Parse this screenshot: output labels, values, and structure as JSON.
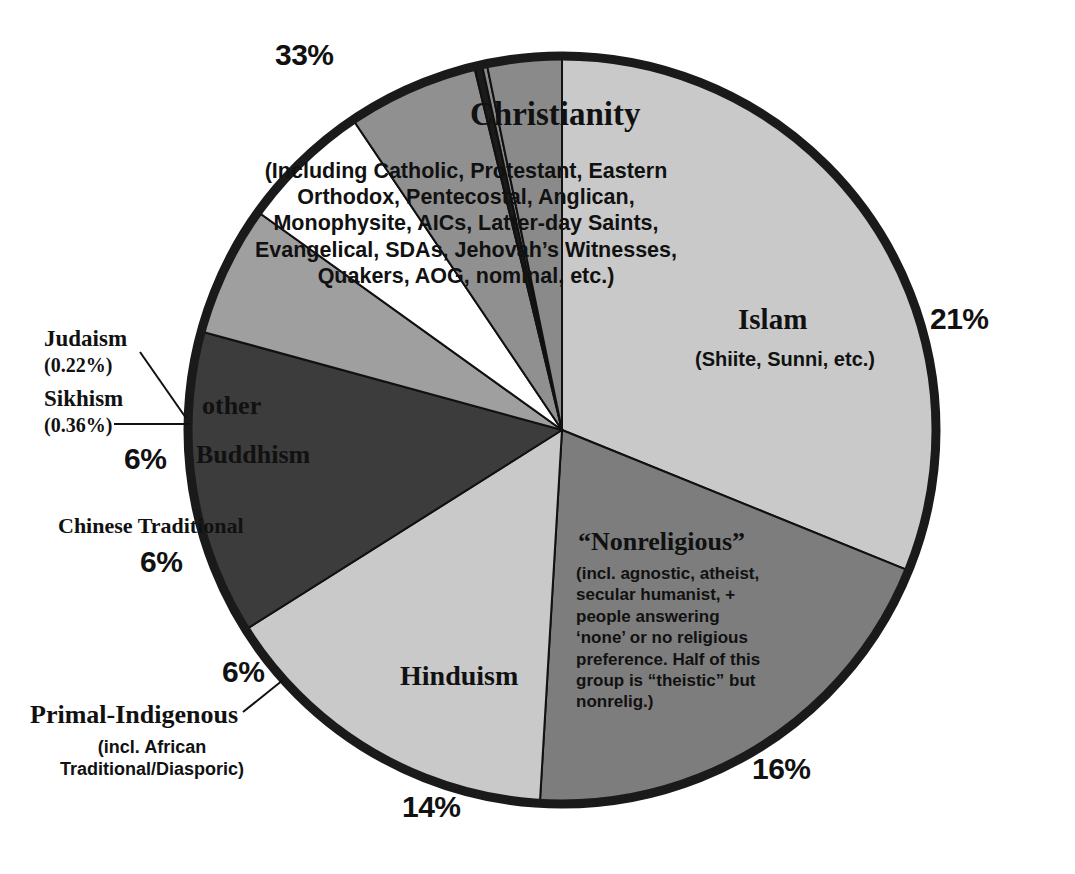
{
  "chart_data": {
    "type": "pie",
    "title": "",
    "legend_position": "inline-labels",
    "center": {
      "x": 562,
      "y": 430
    },
    "radius": 374,
    "start_angle_deg": -90,
    "direction": "clockwise",
    "categories": [
      "Christianity",
      "Islam",
      "“Nonreligious”",
      "Hinduism",
      "Primal-Indigenous",
      "Chinese Traditional",
      "Buddhism",
      "Sikhism",
      "Judaism",
      "other"
    ],
    "values": [
      33,
      21,
      16,
      14,
      6,
      6,
      6,
      0.36,
      0.22,
      3.42
    ],
    "labels": [
      "33%",
      "21%",
      "16%",
      "14%",
      "6%",
      "6%",
      "6%",
      "(0.36%)",
      "(0.22%)",
      ""
    ],
    "colors": [
      "#c9c9c9",
      "#7d7d7d",
      "#c9c9c9",
      "#3c3c3c",
      "#9f9f9f",
      "#ffffff",
      "#909090",
      "#1b1b1b",
      "#8a8a8a",
      "#8a8a8a"
    ],
    "outline_color": "#111111"
  },
  "slices": {
    "christianity": {
      "name": "Christianity",
      "pct": "33%",
      "detail": "(Including Catholic, Protestant, Eastern Orthodox, Pentecostal, Anglican, Monophysite, AICs, Latter-day Saints, Evangelical, SDAs, Jehovah’s Witnesses, Quakers, AOG, nominal, etc.)"
    },
    "islam": {
      "name": "Islam",
      "pct": "21%",
      "detail": "(Shiite, Sunni, etc.)"
    },
    "nonreligious": {
      "name": "“Nonreligious”",
      "pct": "16%",
      "detail": "(incl. agnostic, atheist, secular humanist, + people answering ‘none’ or no religious preference. Half of this group is “theistic” but nonrelig.)"
    },
    "hinduism": {
      "name": "Hinduism",
      "pct": "14%"
    },
    "primal_indigenous": {
      "name": "Primal-Indigenous",
      "pct": "6%",
      "detail": "(incl. African Traditional/Diasporic)"
    },
    "chinese_traditional": {
      "name": "Chinese Traditional",
      "pct": "6%"
    },
    "buddhism": {
      "name": "Buddhism",
      "pct": "6%"
    },
    "sikhism": {
      "name": "Sikhism",
      "pct": "(0.36%)"
    },
    "judaism": {
      "name": "Judaism",
      "pct": "(0.22%)"
    },
    "other": {
      "name": "other"
    }
  }
}
